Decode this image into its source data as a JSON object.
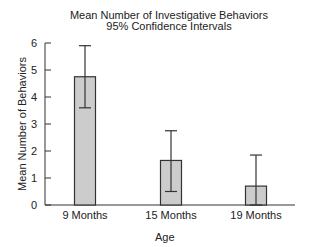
{
  "chart_data": {
    "type": "bar",
    "title": "Mean Number of Investigative Behaviors",
    "subtitle": "95% Confidence Intervals",
    "xlabel": "Age",
    "ylabel": "Mean Number of Behaviors",
    "categories": [
      "9 Months",
      "15 Months",
      "19 Months"
    ],
    "values": [
      4.75,
      1.65,
      0.7
    ],
    "error_bars": {
      "type": "95% CI",
      "lower": [
        3.6,
        0.5,
        0.0
      ],
      "upper": [
        5.9,
        2.75,
        1.85
      ]
    },
    "ylim": [
      0,
      6
    ],
    "yticks": [
      0,
      1,
      2,
      3,
      4,
      5,
      6
    ],
    "grid": false,
    "legend": null,
    "bar_color": "#cccccc",
    "edge_color": "#333333"
  }
}
